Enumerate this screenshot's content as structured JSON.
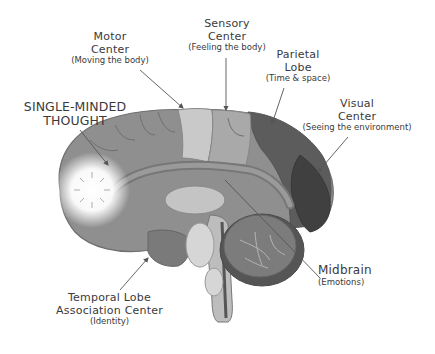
{
  "diagram": {
    "type": "labeled-anatomy",
    "colors": {
      "background": "#ffffff",
      "outline": "#6f6f6f",
      "cortex_front": "#8f8f8f",
      "motor_strip": "#c9c9c9",
      "sensory_strip": "#a9a9a9",
      "parietal": "#5c5c5c",
      "visual": "#404040",
      "cerebellum": "#7c7c7c",
      "glow": "#ffffff",
      "label_text": "#3a3a3a",
      "arrow": "#555555"
    },
    "labels": [
      {
        "id": "single-minded-thought",
        "title": "SINGLE-MINDED THOUGHT",
        "lines": [
          "SINGLE-MINDED",
          "THOUGHT"
        ],
        "subtitle": ""
      },
      {
        "id": "motor-center",
        "title": "Motor Center",
        "lines": [
          "Motor",
          "Center"
        ],
        "subtitle": "(Moving the body)"
      },
      {
        "id": "sensory-center",
        "title": "Sensory Center",
        "lines": [
          "Sensory",
          "Center"
        ],
        "subtitle": "(Feeling the body)"
      },
      {
        "id": "parietal-lobe",
        "title": "Parietal Lobe",
        "lines": [
          "Parietal",
          "Lobe"
        ],
        "subtitle": "(Time & space)"
      },
      {
        "id": "visual-center",
        "title": "Visual Center",
        "lines": [
          "Visual",
          "Center"
        ],
        "subtitle": "(Seeing the environment)"
      },
      {
        "id": "midbrain",
        "title": "Midbrain",
        "lines": [
          "Midbrain"
        ],
        "subtitle": "(Emotions)"
      },
      {
        "id": "temporal-lobe",
        "title": "Temporal Lobe Association Center",
        "lines": [
          "Temporal Lobe",
          "Association Center"
        ],
        "subtitle": "(Identity)"
      }
    ]
  }
}
